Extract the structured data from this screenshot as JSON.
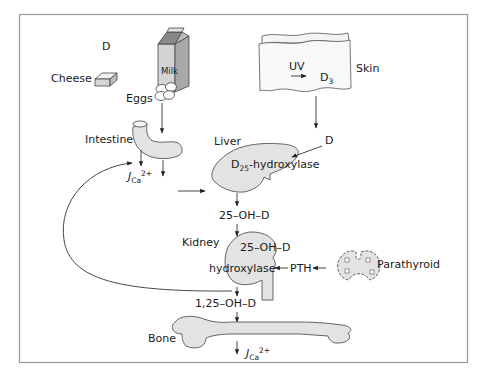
{
  "diagram": {
    "type": "vitamin-d-metabolism-pathway",
    "colors": {
      "background": "#ffffff",
      "frame": "#9a9a9a",
      "organ_fill": "#e3e3e3",
      "stroke": "#333333"
    },
    "sources": {
      "d_label": "D",
      "cheese": "Cheese",
      "milk": "Milk",
      "eggs": "Eggs",
      "skin": "Skin",
      "uv": "UV",
      "d3_main": "D",
      "d3_sub": "3",
      "skin_output": "D"
    },
    "intestine": {
      "label": "Intestine",
      "flux_main": "J",
      "flux_sub": "Ca",
      "flux_sup": "2+"
    },
    "liver": {
      "label": "Liver",
      "enzyme_main": "D",
      "enzyme_sub": "25",
      "enzyme_rest": "-hydroxylase",
      "product": "25–OH–D"
    },
    "kidney": {
      "label": "Kidney",
      "enzyme_line1": "25–OH–D",
      "enzyme_line2": "hydroxylase",
      "product": "1,25–OH–D"
    },
    "parathyroid": {
      "label": "Parathyroid",
      "hormone": "PTH"
    },
    "bone": {
      "label": "Bone",
      "flux_main": "J",
      "flux_sub": "Ca",
      "flux_sup": "2+"
    }
  }
}
